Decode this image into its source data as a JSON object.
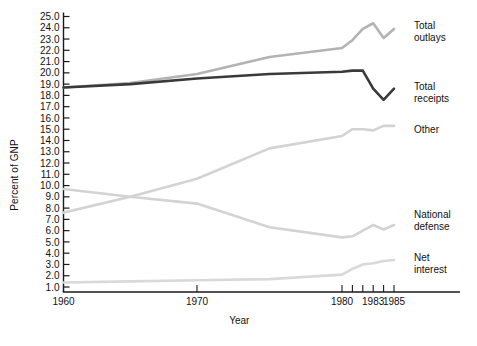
{
  "chart_data": {
    "type": "line",
    "title": "",
    "xlabel": "Year",
    "ylabel": "Percent of GNP",
    "xlim": [
      1960,
      1986.5
    ],
    "ylim": [
      0.5,
      25.4
    ],
    "grid": false,
    "legend_position": "right-inline-labels",
    "x_ticks": [
      1960,
      1970,
      1980,
      1981,
      1982,
      1983,
      1984,
      1985
    ],
    "x_tick_labels": [
      "1960",
      "1970",
      "1980",
      "",
      "",
      "1983",
      "",
      "1985"
    ],
    "y_ticks": [
      1.0,
      2.0,
      3.0,
      4.0,
      5.0,
      6.0,
      7.0,
      8.0,
      9.0,
      10.0,
      11.0,
      12.0,
      13.0,
      14.0,
      15.0,
      16.0,
      17.0,
      18.0,
      19.0,
      20.0,
      21.0,
      22.0,
      23.0,
      24.0,
      25.0
    ],
    "y_tick_labels": [
      "1.0",
      "2.0",
      "3.0",
      "4.0",
      "5.0",
      "6.0",
      "7.0",
      "8.0",
      "9.0",
      "10.0",
      "11.0",
      "12.0",
      "13.0",
      "14.0",
      "15.0",
      "16.0",
      "17.0",
      "18.0",
      "19.0",
      "20.0",
      "21.0",
      "22.0",
      "23.0",
      "24.0",
      "25.0"
    ],
    "x": [
      1960,
      1965,
      1970,
      1975,
      1980,
      1981,
      1982,
      1983,
      1984,
      1985
    ],
    "series": [
      {
        "name": "Total outlays",
        "label": "Total outlays",
        "color": "#b3b3b3",
        "width": 2.6,
        "label_x": 1986.2,
        "label_y": 23.9,
        "values": [
          18.7,
          19.1,
          19.9,
          21.4,
          22.2,
          22.9,
          23.9,
          24.4,
          23.1,
          23.9
        ]
      },
      {
        "name": "Total receipts",
        "label": "Total receipts",
        "color": "#3a3a3a",
        "width": 2.6,
        "label_x": 1986.2,
        "label_y": 18.5,
        "values": [
          18.7,
          19.0,
          19.5,
          19.9,
          20.1,
          20.2,
          20.2,
          18.6,
          17.6,
          18.6
        ]
      },
      {
        "name": "Other",
        "label": "Other",
        "color": "#d3d3d3",
        "width": 2.6,
        "label_x": 1986.2,
        "label_y": 14.7,
        "values": [
          7.6,
          9.0,
          10.6,
          13.3,
          14.4,
          15.0,
          15.0,
          14.9,
          15.3,
          15.3
        ]
      },
      {
        "name": "National defense",
        "label": "National defense",
        "color": "#d3d3d3",
        "width": 2.6,
        "label_x": 1986.2,
        "label_y": 7.1,
        "values": [
          9.7,
          9.0,
          8.4,
          6.3,
          5.4,
          5.5,
          6.0,
          6.5,
          6.1,
          6.5
        ]
      },
      {
        "name": "Net interest",
        "label": "Net interest",
        "color": "#d9d9d9",
        "width": 2.6,
        "label_x": 1986.2,
        "label_y": 3.3,
        "values": [
          1.4,
          1.5,
          1.6,
          1.7,
          2.1,
          2.6,
          3.0,
          3.1,
          3.3,
          3.4
        ]
      }
    ]
  },
  "figure": {
    "caption": ""
  }
}
